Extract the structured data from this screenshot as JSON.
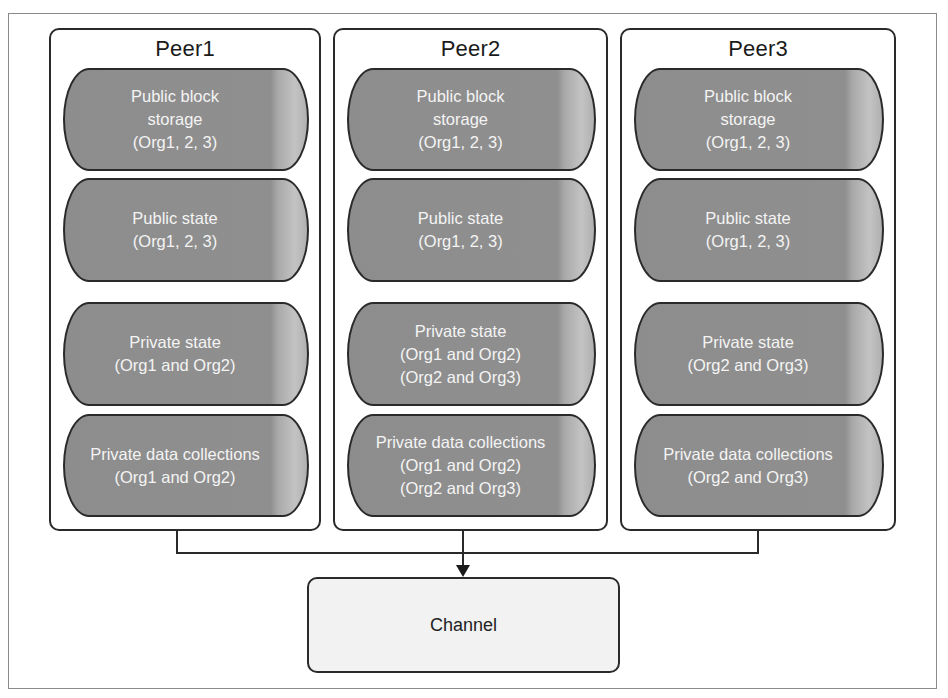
{
  "diagram": {
    "peers": [
      {
        "title": "Peer1",
        "stores": [
          {
            "label": "Public block\nstorage\n(Org1, 2, 3)"
          },
          {
            "label": "Public state\n(Org1, 2, 3)"
          },
          {
            "label": "Private state\n(Org1 and Org2)"
          },
          {
            "label": "Private data collections\n(Org1 and Org2)"
          }
        ]
      },
      {
        "title": "Peer2",
        "stores": [
          {
            "label": "Public block\nstorage\n(Org1, 2, 3)"
          },
          {
            "label": "Public state\n(Org1, 2, 3)"
          },
          {
            "label": "Private state\n(Org1 and Org2)\n(Org2 and Org3)"
          },
          {
            "label": "Private data collections\n(Org1 and Org2)\n(Org2 and Org3)"
          }
        ]
      },
      {
        "title": "Peer3",
        "stores": [
          {
            "label": "Public block\nstorage\n(Org1, 2, 3)"
          },
          {
            "label": "Public state\n(Org1, 2, 3)"
          },
          {
            "label": "Private state\n(Org2 and Org3)"
          },
          {
            "label": "Private data collections\n(Org2 and Org3)"
          }
        ]
      }
    ],
    "channel": {
      "label": "Channel"
    },
    "colors": {
      "cylinder_fill": "#8f8f8f",
      "cylinder_text": "#f4f4f4",
      "border": "#2a2a2a",
      "channel_fill": "#f2f2f2"
    }
  }
}
